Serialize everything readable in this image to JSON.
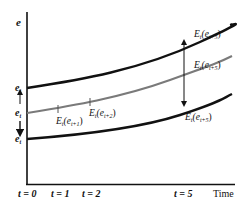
{
  "axes": {
    "y_label": "e",
    "x_label": "Time",
    "x_ticks": [
      {
        "label": "t = 0",
        "x": 30
      },
      {
        "label": "t = 1",
        "x": 62
      },
      {
        "label": "t = 2",
        "x": 92
      },
      {
        "label": "t = 5",
        "x": 184
      }
    ]
  },
  "left_labels": {
    "top": "e",
    "top_sub": "t",
    "mid": "e",
    "mid_sub": "t",
    "bottom": "e",
    "bottom_sub": "t"
  },
  "curves": [
    {
      "name": "upper-bound",
      "color": "#111111",
      "points": [
        [
          27,
          88
        ],
        [
          100,
          75
        ],
        [
          200,
          42
        ],
        [
          232,
          25
        ]
      ]
    },
    {
      "name": "expected-path",
      "color": "#7a7a7a",
      "points": [
        [
          27,
          113
        ],
        [
          60,
          108
        ],
        [
          90,
          102
        ],
        [
          150,
          85
        ],
        [
          232,
          57
        ]
      ]
    },
    {
      "name": "lower-bound",
      "color": "#111111",
      "points": [
        [
          27,
          139
        ],
        [
          100,
          133
        ],
        [
          180,
          115
        ],
        [
          232,
          95
        ]
      ]
    }
  ],
  "annotations": {
    "e1": {
      "main": "E",
      "sub_t": "t",
      "paren": "(e",
      "sub": "t+1",
      "close": ")"
    },
    "e2": {
      "main": "E",
      "sub_t": "t",
      "paren": "(e",
      "sub": "t+2",
      "close": ")"
    },
    "e5_upper": {
      "main": "E",
      "sub_t": "t",
      "paren": "(e",
      "sub": "t+5",
      "close": ")"
    },
    "e5_mid": {
      "main": "E",
      "sub_t": "t",
      "paren": "(e",
      "sub": "t+5",
      "close": ")"
    },
    "e5_lower": {
      "main": "E",
      "sub_t": "t",
      "paren": "(e",
      "sub": "t+5",
      "close": ")"
    }
  }
}
